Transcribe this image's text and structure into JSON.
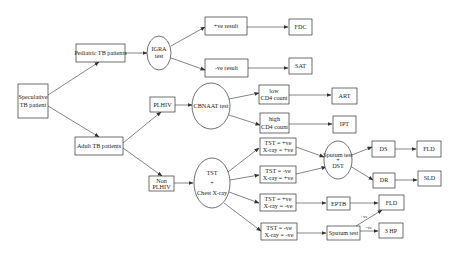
{
  "diagram": {
    "nodes": {
      "speculative": {
        "line1": "Speculative",
        "line2": "TB patient"
      },
      "pediatric": {
        "label": "Pediatric TB patients"
      },
      "igra": {
        "line1": "IGRA",
        "line2": "test"
      },
      "pos_result": {
        "label": "+ve result"
      },
      "neg_result": {
        "label": "-ve result"
      },
      "fdc": {
        "label": "FDC"
      },
      "sat": {
        "label": "SAT"
      },
      "adult": {
        "label": "Adult TB patients"
      },
      "plhiv": {
        "label": "PLHIV"
      },
      "cbnaat": {
        "label": "CBNAAT test"
      },
      "low_cd4": {
        "line1": "low",
        "line2": "CD4 count"
      },
      "high_cd4": {
        "line1": "high",
        "line2": "CD4 count"
      },
      "art": {
        "label": "ART"
      },
      "ipt": {
        "label": "IPT"
      },
      "non_plhiv": {
        "line1": "Non",
        "line2": "PLHIV"
      },
      "tst_xray": {
        "line1": "TST",
        "line2": "+",
        "line3": "Chest X-ray"
      },
      "tst_pos_xray_pos": {
        "line1": "TST = +ve",
        "line2": "X-ray = +ve"
      },
      "tst_neg_xray_pos": {
        "line1": "TST = -ve",
        "line2": "X-ray = +ve"
      },
      "tst_pos_xray_neg": {
        "line1": "TST = +ve",
        "line2": "X-ray = -ve"
      },
      "tst_neg_xray_neg": {
        "line1": "TST = -ve",
        "line2": "X-ray = -ve"
      },
      "sputum_dst": {
        "line1": "Sputum test",
        "line2": "+",
        "line3": "DST"
      },
      "ds": {
        "label": "DS"
      },
      "dr": {
        "label": "DR"
      },
      "fld_top": {
        "label": "FLD"
      },
      "sld": {
        "label": "SLD"
      },
      "eptb": {
        "label": "EPTB"
      },
      "sputum_test": {
        "label": "Sputum test"
      },
      "fld_bottom": {
        "label": "FLD"
      },
      "three_hp": {
        "label": "3 HP"
      }
    },
    "edge_labels": {
      "sputum_pos": "+ve",
      "sputum_neg": "-ve"
    }
  }
}
